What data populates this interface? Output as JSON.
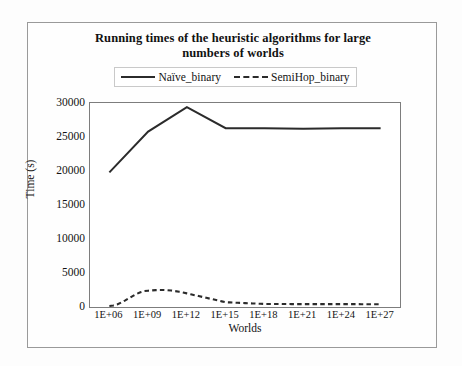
{
  "chart_data": {
    "type": "line",
    "title": "Running times of the heuristic algorithms for large numbers of worlds",
    "title_line1": "Running times of the heuristic algorithms for large",
    "title_line2": "numbers of worlds",
    "xlabel": "Worlds",
    "ylabel": "Time (s)",
    "categories": [
      "1E+06",
      "1E+09",
      "1E+12",
      "1E+15",
      "1E+18",
      "1E+21",
      "1E+24",
      "1E+27"
    ],
    "ytick_labels": [
      "0",
      "5000",
      "10000",
      "15000",
      "20000",
      "25000",
      "30000"
    ],
    "ytick_values": [
      0,
      5000,
      10000,
      15000,
      20000,
      25000,
      30000
    ],
    "ylim": [
      0,
      30000
    ],
    "grid": false,
    "legend_position": "top-center",
    "series": [
      {
        "name": "Naïve_binary",
        "style": "solid",
        "color": "#2b2b2b",
        "values": [
          19800,
          25800,
          29400,
          26300,
          26300,
          26200,
          26300,
          26300
        ]
      },
      {
        "name": "SemiHop_binary",
        "style": "dashed",
        "color": "#2b2b2b",
        "values": [
          150,
          2400,
          2000,
          700,
          450,
          420,
          430,
          400
        ]
      }
    ],
    "series_detail": {
      "note": "SemiHop_binary peaks between 1E+09 and 1E+12",
      "semihop_peak_value": 2700,
      "semihop_peak_x": "1E+10"
    }
  },
  "legend": {
    "entries": [
      {
        "label": "Naïve_binary",
        "marker": "solid-line"
      },
      {
        "label": "SemiHop_binary",
        "marker": "dashed-line"
      }
    ]
  }
}
